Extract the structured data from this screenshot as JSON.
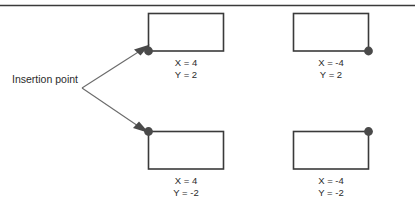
{
  "figure": {
    "rule_color": "#3a3a3a",
    "box_color": "#3a3a3a",
    "dot_color": "#4a4a4a",
    "leader_color": "#6b6b6b",
    "text_color": "#2b2b2b"
  },
  "leader": {
    "line1": "Insertion",
    "line2": "point"
  },
  "boxes": [
    {
      "id": "top-left",
      "insertion_corner": "bottom-left",
      "x_label": "X = 4",
      "y_label": "Y = 2"
    },
    {
      "id": "top-right",
      "insertion_corner": "bottom-right",
      "x_label": "X = -4",
      "y_label": "Y = 2"
    },
    {
      "id": "bottom-left",
      "insertion_corner": "top-left",
      "x_label": "X = 4",
      "y_label": "Y = -2"
    },
    {
      "id": "bottom-right",
      "insertion_corner": "top-right",
      "x_label": "X = -4",
      "y_label": "Y = -2"
    }
  ]
}
